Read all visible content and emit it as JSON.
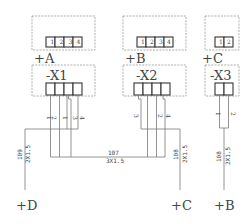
{
  "diagram": {
    "type": "terminal-wiring-diagram",
    "locations": [
      {
        "id": "A",
        "label": "+A",
        "device": "-X1",
        "top_pins": [
          "1",
          "2",
          "3",
          "4"
        ],
        "wire_pins": [
          "1",
          "2",
          "1",
          "3",
          "4"
        ]
      },
      {
        "id": "B",
        "label": "+B",
        "device": "-X2",
        "top_pins": [
          "1",
          "2",
          "3",
          "4"
        ],
        "wire_pins": [
          "3",
          "2",
          "4"
        ]
      },
      {
        "id": "C",
        "label": "+C",
        "device": "-X3",
        "top_pins": [
          "1",
          "2"
        ],
        "wire_pins": [
          "1",
          "2"
        ]
      }
    ],
    "cables": [
      {
        "id": "c109",
        "number": "109",
        "spec": "2X1.5",
        "destination": "+D"
      },
      {
        "id": "c107",
        "number": "107",
        "spec": "3X1.5"
      },
      {
        "id": "c108a",
        "number": "108",
        "spec": "2X1.5",
        "destination": "+C"
      },
      {
        "id": "c108b",
        "number": "108",
        "spec": "2X1.5",
        "destination": "+B"
      }
    ],
    "bottom_labels": [
      "+D",
      "+C",
      "+B"
    ]
  }
}
